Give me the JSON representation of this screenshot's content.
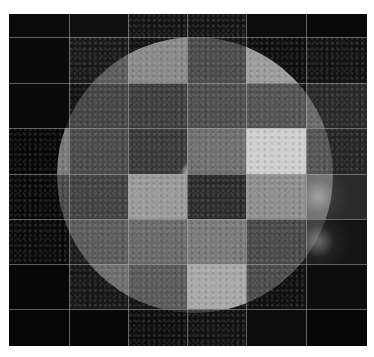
{
  "image": {
    "subject": "Solar disc mosaic composed of grayscale tiles in differing wavelengths",
    "grid": {
      "columns": 6,
      "rows": 8,
      "col_edges": [
        0,
        60,
        119,
        178,
        237,
        297,
        358
      ],
      "row_edges": [
        0,
        23,
        69,
        114,
        160,
        205,
        250,
        295,
        332
      ]
    },
    "sun": {
      "cx": 186,
      "cy": 161,
      "r": 138
    },
    "colors": {
      "background": "#ffffff",
      "space": "#050505",
      "gridline": "#aaaaaa"
    },
    "tiles": [
      [
        {
          "bg": "#0b0b0b",
          "disc": "#1a1a1a",
          "style": "space"
        },
        {
          "bg": "#101010",
          "disc": "#262626",
          "style": "space"
        },
        {
          "bg": "#141414",
          "disc": "#3a3a3a",
          "style": "corona"
        },
        {
          "bg": "#141414",
          "disc": "#3c3c3c",
          "style": "corona"
        },
        {
          "bg": "#0c0c0c",
          "disc": "#1c1c1c",
          "style": "space"
        },
        {
          "bg": "#090909",
          "disc": "#161616",
          "style": "space"
        }
      ],
      [
        {
          "bg": "#0a0a0a",
          "disc": "#202020",
          "style": "space"
        },
        {
          "bg": "#1a1a1a",
          "disc": "#5c5c5c",
          "style": "limb-glow"
        },
        {
          "bg": "#141414",
          "disc": "#8a8a8a",
          "style": "granular"
        },
        {
          "bg": "#161616",
          "disc": "#4c4c4c",
          "style": "euv"
        },
        {
          "bg": "#0e0e0e",
          "disc": "#9c9c9c",
          "style": "bright-disc"
        },
        {
          "bg": "#131313",
          "disc": "#262626",
          "style": "corona"
        }
      ],
      [
        {
          "bg": "#0a0a0a",
          "disc": "#252525",
          "style": "space"
        },
        {
          "bg": "#121212",
          "disc": "#454545",
          "style": "euv"
        },
        {
          "bg": "#111111",
          "disc": "#3e3e3e",
          "style": "euv"
        },
        {
          "bg": "#111111",
          "disc": "#4e4e4e",
          "style": "granular"
        },
        {
          "bg": "#111111",
          "disc": "#545454",
          "style": "granular"
        },
        {
          "bg": "#2a2a2a",
          "disc": "#6a6a6a",
          "style": "limb-glow"
        }
      ],
      [
        {
          "bg": "#070707",
          "disc": "#7a7a7a",
          "style": "bright-disc"
        },
        {
          "bg": "#222222",
          "disc": "#4a4a4a",
          "style": "granular"
        },
        {
          "bg": "#1c1c1c",
          "disc": "#3a3a3a",
          "style": "active-region"
        },
        {
          "bg": "#1c1c1c",
          "disc": "#707070",
          "style": "granular"
        },
        {
          "bg": "#1c1c1c",
          "disc": "#cfcfcf",
          "style": "bright-disc"
        },
        {
          "bg": "#262626",
          "disc": "#555555",
          "style": "euv"
        }
      ],
      [
        {
          "bg": "#090909",
          "disc": "#4a4a4a",
          "style": "euv"
        },
        {
          "bg": "#1c1c1c",
          "disc": "#424242",
          "style": "euv"
        },
        {
          "bg": "#1c1c1c",
          "disc": "#9a9a9a",
          "style": "bright-disc"
        },
        {
          "bg": "#1c1c1c",
          "disc": "#2c2c2c",
          "style": "euv"
        },
        {
          "bg": "#1c1c1c",
          "disc": "#8e8e8e",
          "style": "granular"
        },
        {
          "bg": "#2a2a2a",
          "disc": "#6e6e6e",
          "style": "flare"
        }
      ],
      [
        {
          "bg": "#0a0a0a",
          "disc": "#4a4a4a",
          "style": "limb-glow"
        },
        {
          "bg": "#1c1c1c",
          "disc": "#5c5c5c",
          "style": "granular"
        },
        {
          "bg": "#1c1c1c",
          "disc": "#6a6a6a",
          "style": "active-region"
        },
        {
          "bg": "#1c1c1c",
          "disc": "#7a7a7a",
          "style": "active-region"
        },
        {
          "bg": "#1c1c1c",
          "disc": "#4a4a4a",
          "style": "granular"
        },
        {
          "bg": "#141414",
          "disc": "#3a3a3a",
          "style": "flare"
        }
      ],
      [
        {
          "bg": "#070707",
          "disc": "#151515",
          "style": "space"
        },
        {
          "bg": "#181818",
          "disc": "#6e6e6e",
          "style": "limb-glow"
        },
        {
          "bg": "#141414",
          "disc": "#5a5a5a",
          "style": "granular"
        },
        {
          "bg": "#141414",
          "disc": "#a8a8a8",
          "style": "bright-disc"
        },
        {
          "bg": "#101010",
          "disc": "#4c4c4c",
          "style": "granular"
        },
        {
          "bg": "#0d0d0d",
          "disc": "#1c1c1c",
          "style": "space"
        }
      ],
      [
        {
          "bg": "#060606",
          "disc": "#101010",
          "style": "space"
        },
        {
          "bg": "#080808",
          "disc": "#141414",
          "style": "space"
        },
        {
          "bg": "#0e0e0e",
          "disc": "#2a2a2a",
          "style": "corona"
        },
        {
          "bg": "#121212",
          "disc": "#3a3a3a",
          "style": "corona"
        },
        {
          "bg": "#0c0c0c",
          "disc": "#1e1e1e",
          "style": "space"
        },
        {
          "bg": "#060606",
          "disc": "#0e0e0e",
          "style": "space"
        }
      ]
    ]
  }
}
